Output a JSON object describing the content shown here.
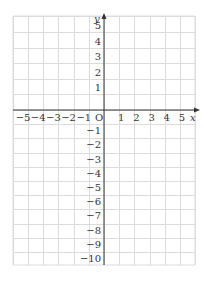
{
  "diagram": {
    "type": "coordinate-plane",
    "x_axis": {
      "label": "x",
      "min": -6,
      "max": 6,
      "tick_labels": [
        "−5",
        "−4",
        "−3",
        "−2",
        "−1",
        "1",
        "2",
        "3",
        "4",
        "5"
      ],
      "tick_values": [
        -5,
        -4,
        -3,
        -2,
        -1,
        1,
        2,
        3,
        4,
        5
      ]
    },
    "y_axis": {
      "label": "y",
      "min": -11,
      "max": 6,
      "tick_labels": [
        "5",
        "4",
        "3",
        "2",
        "1",
        "−1",
        "−2",
        "−3",
        "−4",
        "−5",
        "−6",
        "−7",
        "−8",
        "−9",
        "−10"
      ],
      "tick_values": [
        5,
        4,
        3,
        2,
        1,
        -1,
        -2,
        -3,
        -4,
        -5,
        -6,
        -7,
        -8,
        -9,
        -10
      ]
    },
    "origin_label": "O",
    "grid": true,
    "colors": {
      "grid": "#dcdcdc",
      "axis": "#333333",
      "text": "#333333",
      "background": "#ffffff"
    }
  }
}
